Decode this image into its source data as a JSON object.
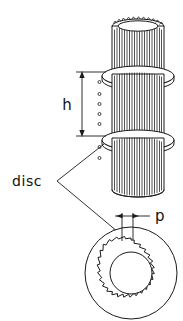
{
  "figure": {
    "kind": "engineering-line-drawing",
    "background_color": "#ffffff",
    "ink_color": "#1a1a1a",
    "labels": {
      "height_symbol": "h",
      "pitch_symbol": "p",
      "disc_callout": "disc"
    },
    "annotations": [
      {
        "name": "height-dimension",
        "symbol": "h",
        "style": "double-arrow-vertical",
        "between": "upper disc and lower disc"
      },
      {
        "name": "pitch-dimension",
        "symbol": "p",
        "style": "double-arrow-outward",
        "between": "two adjacent spline teeth"
      },
      {
        "name": "disc-leader",
        "text": "disc",
        "points_to": [
          "lower disc edge",
          "plan view disc"
        ]
      }
    ],
    "views": {
      "isometric": {
        "name": "splined shaft with stacked discs",
        "spline_count": 22,
        "disc_count": 2,
        "segment_count": 3
      },
      "plan": {
        "name": "disc plan view",
        "tooth_count": 22,
        "rings": [
          "outer disc rim",
          "toothed bore ring",
          "inner bore"
        ]
      }
    }
  }
}
